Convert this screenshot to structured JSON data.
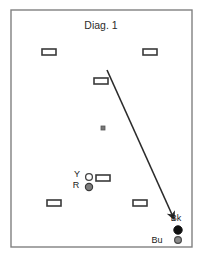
{
  "figure": {
    "title": "Diag. 1",
    "title_x": 101,
    "title_y": 29,
    "background_color": "#ffffff",
    "border_color": "#6b6b6b",
    "line_color": "#2b2b2b"
  },
  "court": {
    "x": 11,
    "y": 10,
    "width": 181,
    "height": 237,
    "stroke": "#808080",
    "stroke_width": 1.4,
    "fill": "#ffffff"
  },
  "chart_data": {
    "type": "diagram",
    "title": "Diag. 1",
    "xlabel": "",
    "ylabel": "",
    "xlim": [
      11,
      192
    ],
    "ylim": [
      10,
      247
    ],
    "grid": false,
    "legend": "none",
    "hoops": [
      {
        "name": "hoop-top-left",
        "x": 49,
        "y": 52,
        "w": 14,
        "h": 6
      },
      {
        "name": "hoop-top-right",
        "x": 150,
        "y": 52,
        "w": 14,
        "h": 6
      },
      {
        "name": "hoop-upper-middle",
        "x": 101,
        "y": 81,
        "w": 14,
        "h": 6
      },
      {
        "name": "hoop-lower-middle",
        "x": 103,
        "y": 178,
        "w": 14,
        "h": 6
      },
      {
        "name": "hoop-bottom-left",
        "x": 54,
        "y": 203,
        "w": 14,
        "h": 6
      },
      {
        "name": "hoop-bottom-right",
        "x": 140,
        "y": 203,
        "w": 14,
        "h": 6
      }
    ],
    "hoop_style": {
      "fill": "#ffffff",
      "stroke": "#3a3a3a",
      "stroke_width": 1.6
    },
    "peg": {
      "name": "centre-peg",
      "x": 103,
      "y": 128,
      "size": 4,
      "fill": "#777777",
      "stroke": "#555555"
    },
    "balls": [
      {
        "name": "ball-yellow",
        "label": "Y",
        "label_x": 77,
        "label_y": 177,
        "cx": 89,
        "cy": 177,
        "r": 3.4,
        "fill": "#ffffff",
        "stroke": "#444444",
        "stroke_width": 1.3
      },
      {
        "name": "ball-red",
        "label": "R",
        "label_x": 76,
        "label_y": 188,
        "cx": 89,
        "cy": 187,
        "r": 3.6,
        "fill": "#7d7d7d",
        "stroke": "#3a3a3a",
        "stroke_width": 1.2
      },
      {
        "name": "ball-black",
        "label": "Bk",
        "label_x": 176,
        "label_y": 221,
        "cx": 178,
        "cy": 230,
        "r": 4.2,
        "fill": "#101010",
        "stroke": "#101010",
        "stroke_width": 1
      },
      {
        "name": "ball-blue",
        "label": "Bu",
        "label_x": 157,
        "label_y": 243,
        "cx": 178,
        "cy": 240,
        "r": 3.4,
        "fill": "#8a8a8a",
        "stroke": "#4a4a4a",
        "stroke_width": 1.2
      }
    ],
    "arrow": {
      "name": "shot-trajectory-arrow",
      "x1": 107,
      "y1": 70,
      "x2": 174,
      "y2": 219,
      "stroke": "#2b2b2b",
      "stroke_width": 1.6,
      "head": "filled-triangle"
    }
  }
}
